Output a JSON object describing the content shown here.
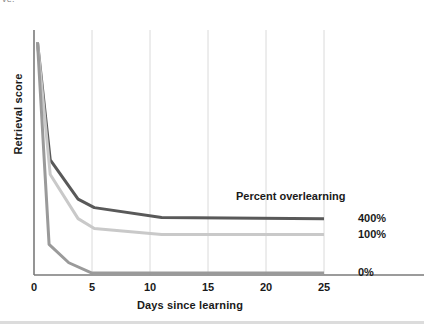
{
  "figure": {
    "clipped_header_text": "ve.",
    "background": "#ffffff",
    "footer_rule_color": "#dcdcdc"
  },
  "chart_data": {
    "type": "line",
    "title": "",
    "xlabel": "Days since learning",
    "ylabel": "Retrieval score",
    "annotation": "Percent overlearning",
    "xlim": [
      0,
      27.5
    ],
    "ylim": [
      0,
      100
    ],
    "xticks": [
      0,
      5,
      10,
      15,
      20,
      25
    ],
    "xtick_labels": [
      "0",
      "5",
      "10",
      "15",
      "20",
      "25"
    ],
    "yticks": [],
    "ytick_labels": [],
    "grid": "vertical",
    "grid_color": "#dadada",
    "axis_color": "#7a7a7a",
    "legend_position": "right-of-axes",
    "series": [
      {
        "name": "400%",
        "label": "400%",
        "color": "#595959",
        "linewidth": 3,
        "x": [
          0.3,
          1.4,
          3.8,
          5.2,
          11.0,
          25.0
        ],
        "y": [
          95,
          47,
          31,
          27.5,
          23.5,
          23.0
        ]
      },
      {
        "name": "100%",
        "label": "100%",
        "color": "#c9c9c9",
        "linewidth": 3,
        "x": [
          0.3,
          1.4,
          3.8,
          5.2,
          11.0,
          25.0
        ],
        "y": [
          95,
          41,
          23,
          19.0,
          16.5,
          16.5
        ]
      },
      {
        "name": "0%",
        "label": "0%",
        "color": "#9a9a9a",
        "linewidth": 3,
        "x": [
          0.3,
          1.3,
          3.0,
          5.0,
          25.0
        ],
        "y": [
          95,
          12.5,
          5.0,
          0.8,
          0.8
        ]
      }
    ]
  }
}
